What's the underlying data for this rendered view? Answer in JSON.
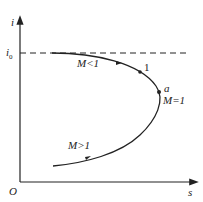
{
  "diagram": {
    "axes": {
      "y_label": "i",
      "x_label": "s",
      "origin_label": "O"
    },
    "reference_line": {
      "label": "i",
      "subscript": "0",
      "style": "dashed"
    },
    "curve_labels": {
      "subsonic": "M<1",
      "point_1": "1",
      "point_a": "a",
      "sonic": "M=1",
      "supersonic": "M>1"
    },
    "colors": {
      "line": "#222222",
      "background": "#ffffff"
    }
  }
}
